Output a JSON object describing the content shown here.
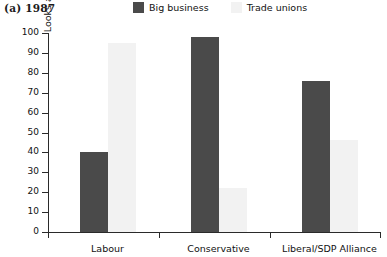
{
  "title": "(a) 1987",
  "legend": {
    "items": [
      {
        "label": "Big business",
        "color": "#4a4a4a",
        "icon": "square-swatch-icon"
      },
      {
        "label": "Trade unions",
        "color": "#f2f2f2",
        "icon": "square-swatch-icon"
      }
    ]
  },
  "axes": {
    "ylabel": "'Looks after interests closely' (%)",
    "xlabel": "",
    "yticks": [
      "0",
      "10",
      "20",
      "30",
      "40",
      "50",
      "60",
      "70",
      "80",
      "90",
      "100"
    ]
  },
  "chart_data": {
    "type": "bar",
    "title": "(a) 1987",
    "subtitle": "",
    "xlabel": "",
    "ylabel": "'Looks after interests closely' (%)",
    "categories": [
      "Labour",
      "Conservative",
      "Liberal/SDP Alliance"
    ],
    "series": [
      {
        "name": "Big business",
        "color": "#4a4a4a",
        "values": [
          40,
          98,
          76
        ]
      },
      {
        "name": "Trade unions",
        "color": "#f2f2f2",
        "values": [
          95,
          22,
          46
        ]
      }
    ],
    "ylim": [
      0,
      100
    ],
    "ytick_step": 10,
    "grid": false,
    "legend_position": "top-center"
  }
}
